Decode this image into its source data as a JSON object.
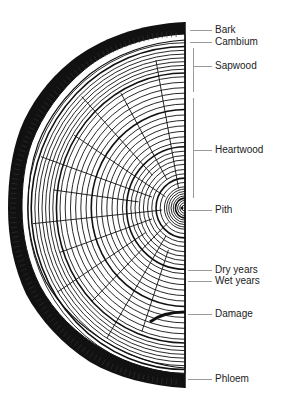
{
  "diagram": {
    "colors": {
      "ink": "#111111",
      "background": "#ffffff",
      "leader": "#9a9a9a"
    },
    "labels": [
      {
        "id": "bark",
        "text": "Bark",
        "y": 30
      },
      {
        "id": "cambium",
        "text": "Cambium",
        "y": 42
      },
      {
        "id": "sapwood",
        "text": "Sapwood",
        "y": 66
      },
      {
        "id": "heartwood",
        "text": "Heartwood",
        "y": 150
      },
      {
        "id": "pith",
        "text": "Pith",
        "y": 210
      },
      {
        "id": "dry-years",
        "text": "Dry years",
        "y": 270
      },
      {
        "id": "wet-years",
        "text": "Wet years",
        "y": 281
      },
      {
        "id": "damage",
        "text": "Damage",
        "y": 314
      },
      {
        "id": "phloem",
        "text": "Phloem",
        "y": 379
      }
    ]
  }
}
